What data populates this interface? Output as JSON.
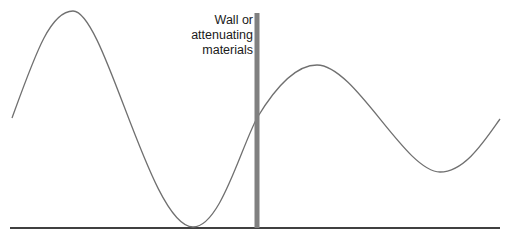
{
  "diagram": {
    "label_lines": [
      "Wall or",
      "attenuating",
      "materials"
    ],
    "colors": {
      "wave": "#707070",
      "wall": "#808080",
      "baseline": "#404040",
      "text": "#1a1a1a"
    },
    "wave_points": [
      {
        "x": 12,
        "y": 118
      },
      {
        "x": 73,
        "y": 11
      },
      {
        "x": 193,
        "y": 227
      },
      {
        "x": 257,
        "y": 118
      },
      {
        "x": 317,
        "y": 65
      },
      {
        "x": 440,
        "y": 172
      },
      {
        "x": 500,
        "y": 119
      }
    ],
    "wall": {
      "x": 257,
      "top": 13,
      "bottom": 228,
      "width": 5
    },
    "baseline": {
      "x1": 10,
      "x2": 500,
      "y": 228
    }
  }
}
